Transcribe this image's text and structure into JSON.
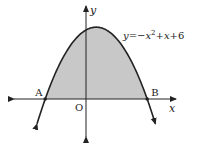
{
  "figure": {
    "equation_label": "y=−x²+x+6",
    "equation_parts": {
      "lhs": "y",
      "eq": "=",
      "minus": "−",
      "x1": "x",
      "exp": "2",
      "plus1": "+",
      "x2": "x",
      "plus2": "+",
      "const": "6"
    },
    "function": {
      "a": -1,
      "b": 1,
      "c": 6
    },
    "x_axis_label": "x",
    "y_axis_label": "y",
    "origin_label": "O",
    "points": [
      {
        "name": "A",
        "x": -2,
        "y": 0
      },
      {
        "name": "B",
        "x": 3,
        "y": 0
      }
    ],
    "shaded_region": {
      "from_x": -2,
      "to_x": 3,
      "description": "region between parabola and x-axis"
    },
    "curve_domain": [
      -2.4,
      3.4
    ],
    "colors": {
      "stroke": "#222222",
      "fill": "#c8c8c8"
    }
  }
}
